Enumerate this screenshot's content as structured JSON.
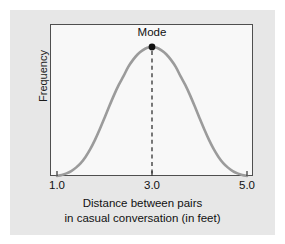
{
  "figure": {
    "background_color": "#e7e7e7",
    "plot_background_color": "#f8f8f8",
    "frame_color": "#4f4f4f"
  },
  "annotation": {
    "mode_label": "Mode",
    "mode_marker": "mode-point-marker",
    "mode_dashed_line": "mode-dashed-line"
  },
  "axes": {
    "ylabel": "Frequency",
    "xtick_labels": [
      "1.0",
      "3.0",
      "5.0"
    ],
    "caption_line_1": "Distance between pairs",
    "caption_line_2": "in casual conversation (in feet)"
  },
  "chart_data": {
    "type": "line",
    "title": "",
    "subtitle": "",
    "xlabel": "Distance between pairs in casual conversation (in feet)",
    "ylabel": "Frequency",
    "xlim": [
      1.0,
      5.0
    ],
    "ylim": [
      0,
      1.0
    ],
    "xticks": [
      1.0,
      3.0,
      5.0
    ],
    "xtick_labels": [
      "1.0",
      "3.0",
      "5.0"
    ],
    "yticks": [],
    "ytick_labels": [],
    "grid": false,
    "legend": null,
    "curve_color": "#9b9b9b",
    "curve_width": 2.6,
    "annotations": [
      {
        "label": "Mode",
        "x": 3.0,
        "y": 1.0,
        "marker": "filled-circle",
        "marker_color": "#111111",
        "dashed_guide_line": true
      }
    ],
    "series": [
      {
        "name": "Frequency distribution",
        "description": "Symmetric unimodal bell-shaped curve peaking at 3.0 feet",
        "x": [
          1.0,
          1.1,
          1.2,
          1.3,
          1.4,
          1.5,
          1.6,
          1.7,
          1.8,
          1.9,
          2.0,
          2.1,
          2.2,
          2.3,
          2.4,
          2.5,
          2.6,
          2.7,
          2.8,
          2.9,
          3.0,
          3.1,
          3.2,
          3.3,
          3.4,
          3.5,
          3.6,
          3.7,
          3.8,
          3.9,
          4.0,
          4.1,
          4.2,
          4.3,
          4.4,
          4.5,
          4.6,
          4.7,
          4.8,
          4.9,
          5.0
        ],
        "y": [
          0.0,
          0.008,
          0.02,
          0.038,
          0.065,
          0.1,
          0.148,
          0.208,
          0.28,
          0.362,
          0.45,
          0.54,
          0.627,
          0.706,
          0.774,
          0.846,
          0.9,
          0.944,
          0.974,
          0.994,
          1.0,
          0.994,
          0.974,
          0.944,
          0.9,
          0.846,
          0.774,
          0.706,
          0.627,
          0.54,
          0.45,
          0.362,
          0.28,
          0.208,
          0.148,
          0.1,
          0.065,
          0.038,
          0.02,
          0.008,
          0.0
        ]
      }
    ]
  }
}
